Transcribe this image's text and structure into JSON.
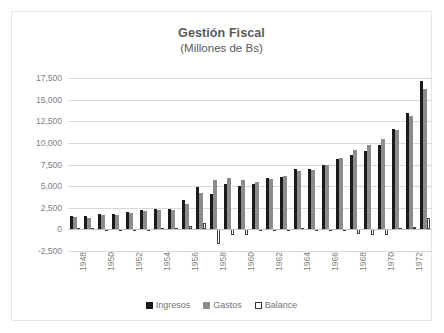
{
  "chart_data": {
    "type": "bar",
    "title": "Gestión Fiscal",
    "subtitle": "(Millones de Bs)",
    "xlabel": "",
    "ylabel": "",
    "ylim": [
      -2500,
      17500
    ],
    "ytick_step": 2500,
    "ytick_labels": [
      "17,500",
      "15,000",
      "12,500",
      "10,000",
      "7,500",
      "5,000",
      "2,500",
      "0",
      "-2,500"
    ],
    "ytick_values": [
      17500,
      15000,
      12500,
      10000,
      7500,
      5000,
      2500,
      0,
      -2500
    ],
    "grid": true,
    "legend_position": "bottom",
    "categories": [
      "1948",
      "1949",
      "1950",
      "1951",
      "1952",
      "1953",
      "1954",
      "1955",
      "1956",
      "1957",
      "1958",
      "1959",
      "1960",
      "1961",
      "1962",
      "1963",
      "1964",
      "1965",
      "1966",
      "1967",
      "1968",
      "1969",
      "1970",
      "1971",
      "1972",
      "1973"
    ],
    "xtick_labels_shown": [
      "1948",
      "1950",
      "1952",
      "1954",
      "1956",
      "1958",
      "1960",
      "1962",
      "1964",
      "1966",
      "1968",
      "1970",
      "1972"
    ],
    "series": [
      {
        "name": "Ingresos",
        "color": "#1a1a1a",
        "values": [
          1550,
          1500,
          1750,
          1800,
          2050,
          2200,
          2350,
          2400,
          3350,
          4900,
          4050,
          5250,
          5050,
          5300,
          5900,
          6050,
          6950,
          6950,
          7500,
          8100,
          8650,
          9050,
          9800,
          11650,
          13400,
          17200
        ]
      },
      {
        "name": "Gastos",
        "color": "#8c8c8c",
        "values": [
          1400,
          1350,
          1650,
          1700,
          1950,
          2100,
          2200,
          2250,
          2950,
          4200,
          5750,
          5900,
          5700,
          5450,
          5800,
          6150,
          6750,
          6900,
          7400,
          8300,
          9150,
          9750,
          10500,
          11450,
          13150,
          16200
        ]
      },
      {
        "name": "Balance",
        "color": "#ffffff",
        "values": [
          150,
          150,
          100,
          100,
          100,
          100,
          150,
          150,
          400,
          700,
          -1700,
          -650,
          -650,
          -150,
          100,
          -100,
          200,
          50,
          100,
          -200,
          -500,
          -700,
          -700,
          200,
          250,
          1300
        ]
      }
    ]
  },
  "legend": {
    "items": [
      {
        "label": "Ingresos",
        "swatch": "swatch-black"
      },
      {
        "label": "Gastos",
        "swatch": "swatch-gray"
      },
      {
        "label": "Balance",
        "swatch": "swatch-white"
      }
    ]
  }
}
